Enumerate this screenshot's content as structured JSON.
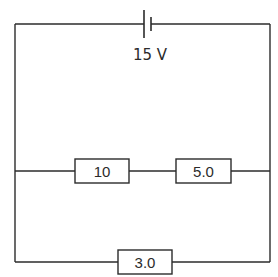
{
  "diagram": {
    "type": "circuit",
    "battery": {
      "label": "15 V",
      "position": "top wire"
    },
    "resistors": [
      {
        "id": "r1",
        "label": "10",
        "branch": "middle",
        "order": 1
      },
      {
        "id": "r2",
        "label": "5.0",
        "branch": "middle",
        "order": 2
      },
      {
        "id": "r3",
        "label": "3.0",
        "branch": "bottom",
        "order": 1
      }
    ],
    "topology": "Battery in series with two parallel branches: middle branch has 10 and 5.0 in series; bottom branch has 3.0",
    "colors": {
      "line": "#2b2b2b",
      "background": "#ffffff"
    }
  }
}
